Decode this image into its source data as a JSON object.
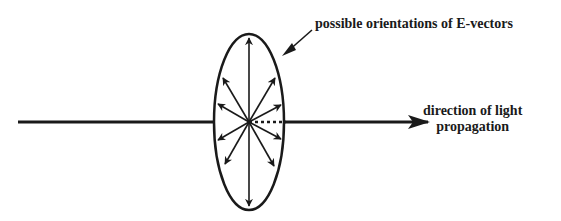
{
  "diagram": {
    "labels": {
      "e_vectors": "possible orientations of E-vectors",
      "direction_line1": "direction of light",
      "direction_line2": "propagation"
    },
    "colors": {
      "stroke": "#1a1a1a",
      "background": "#ffffff"
    },
    "elements": {
      "propagation_axis": "horizontal arrow pointing right",
      "ellipse": "plane of E-vector oscillation",
      "vectors_count": 12,
      "dotted_segment": "axis behind ellipse plane"
    }
  }
}
